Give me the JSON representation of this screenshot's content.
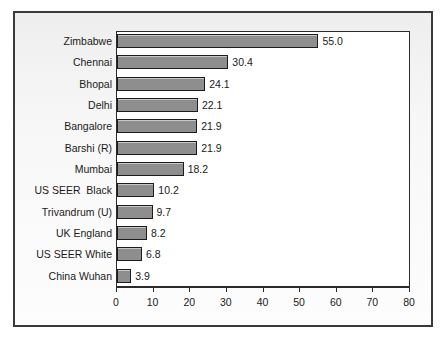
{
  "chart_data": {
    "type": "bar",
    "orientation": "horizontal",
    "title": "",
    "xlabel": "",
    "ylabel": "",
    "xlim": [
      0,
      80
    ],
    "xticks": [
      0,
      10,
      20,
      30,
      40,
      50,
      60,
      70,
      80
    ],
    "xtick_labels": [
      "0",
      "10",
      "20",
      "30",
      "40",
      "50",
      "60",
      "70",
      "80"
    ],
    "grid": false,
    "legend": false,
    "bar_color": "#8e8e8e",
    "bar_edge_color": "#1c1c1c",
    "plot_background": "#ffffff",
    "frame_background": "#f4f4f4",
    "categories": [
      "Zimbabwe",
      "Chennai",
      "Bhopal",
      "Delhi",
      "Bangalore",
      "Barshi (R)",
      "Mumbai",
      "US SEER  Black",
      "Trivandrum (U)",
      "UK England",
      "US SEER White",
      "China Wuhan"
    ],
    "values": [
      55.0,
      30.4,
      24.1,
      22.1,
      21.9,
      21.9,
      18.2,
      10.2,
      9.7,
      8.2,
      6.8,
      3.9
    ],
    "value_labels": [
      "55.0",
      "30.4",
      "24.1",
      "22.1",
      "21.9",
      "21.9",
      "18.2",
      "10.2",
      "9.7",
      "8.2",
      "6.8",
      "3.9"
    ]
  }
}
